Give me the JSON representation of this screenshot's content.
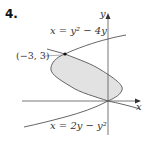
{
  "problem_number": "4.",
  "axes": {
    "x_label": "x",
    "y_label": "y"
  },
  "curves": [
    {
      "label": "x = y² − 4y",
      "equation": "x = y^2 - 4y"
    },
    {
      "label": "x = 2y − y²",
      "equation": "x = 2y - y^2"
    }
  ],
  "point": {
    "label": "(−3, 3)",
    "x": -3,
    "y": 3
  },
  "region": {
    "fill": "#e2e2e2",
    "between": "x = y^2 - 4y and x = 2y - y^2, 0 ≤ y ≤ 3"
  },
  "colors": {
    "curve": "#555555",
    "axis": "#555555",
    "fill": "#e2e2e2"
  }
}
